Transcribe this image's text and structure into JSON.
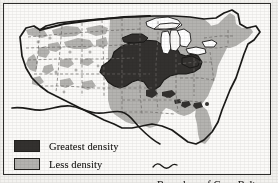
{
  "figure": {
    "type": "thematic-map",
    "palette": {
      "greatest_density": "#33312f",
      "less_density": "#b4b3b0",
      "no_density": "#fbfaf8",
      "water": "#ffffff",
      "outline": "#23221f",
      "state_border": "#6e6c68",
      "paper": "#f2f1ee"
    }
  },
  "legend": {
    "greatest": {
      "label": "Greatest density",
      "swatch_name": "greatest-density-swatch",
      "color": "#33312f"
    },
    "less": {
      "label": "Less density",
      "swatch_name": "less-density-swatch",
      "color": "#b4b3b0"
    },
    "boundary": {
      "label": "Boundary of Corn Belt",
      "symbol_name": "wavy-line-symbol",
      "color": "#23221f"
    }
  },
  "map": {
    "country_outline_name": "united-states-outline",
    "water_features": [
      "Great Lakes"
    ],
    "regions": [
      {
        "name": "western-states",
        "density": "none"
      },
      {
        "name": "scattered-western-patches",
        "density": "less"
      },
      {
        "name": "great-plains-eastern",
        "density": "less"
      },
      {
        "name": "corn-belt-core",
        "density": "greatest"
      },
      {
        "name": "southeastern-states",
        "density": "less"
      },
      {
        "name": "northeastern-states",
        "density": "less"
      },
      {
        "name": "florida-peninsula",
        "density": "less"
      },
      {
        "name": "southeastern-dark-patches",
        "density": "greatest"
      }
    ]
  }
}
